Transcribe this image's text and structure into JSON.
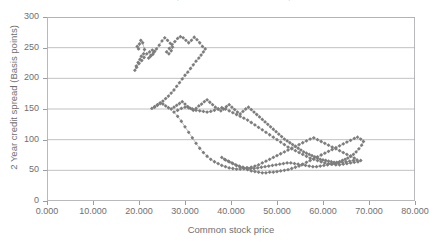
{
  "chart_data": {
    "type": "scatter",
    "title": "2 Year credit spread versus common stock price",
    "xlabel": "Common stock price",
    "ylabel": "2 Year credit spread (Basis points)",
    "xlim": [
      0,
      80
    ],
    "ylim": [
      0,
      300
    ],
    "xticks": [
      "0.000",
      "10.000",
      "20.000",
      "30.000",
      "40.000",
      "50.000",
      "60.000",
      "70.000",
      "80.000"
    ],
    "xtick_values": [
      0,
      10,
      20,
      30,
      40,
      50,
      60,
      70,
      80
    ],
    "yticks": [
      "0",
      "50",
      "100",
      "150",
      "200",
      "250",
      "300"
    ],
    "ytick_values": [
      0,
      50,
      100,
      150,
      200,
      250,
      300
    ],
    "grid": "horizontal",
    "legend": "none",
    "marker": "diamond",
    "marker_color": "#7d7d7d",
    "line_color": "#8e8e8e",
    "connected": true,
    "series": [
      {
        "name": "2 Year credit spread vs common stock price",
        "points": [
          [
            19.6,
            252
          ],
          [
            19.9,
            248
          ],
          [
            20.1,
            256
          ],
          [
            20.4,
            262
          ],
          [
            20.8,
            258
          ],
          [
            21.2,
            247
          ],
          [
            21.0,
            240
          ],
          [
            20.5,
            236
          ],
          [
            20.2,
            231
          ],
          [
            19.8,
            226
          ],
          [
            19.4,
            220
          ],
          [
            19.1,
            213
          ],
          [
            19.5,
            218
          ],
          [
            20.0,
            224
          ],
          [
            20.6,
            229
          ],
          [
            21.1,
            234
          ],
          [
            21.7,
            240
          ],
          [
            22.3,
            243
          ],
          [
            22.9,
            246
          ],
          [
            23.4,
            244
          ],
          [
            23.0,
            239
          ],
          [
            22.5,
            236
          ],
          [
            22.1,
            233
          ],
          [
            22.6,
            238
          ],
          [
            23.2,
            242
          ],
          [
            23.8,
            248
          ],
          [
            24.4,
            254
          ],
          [
            25.0,
            261
          ],
          [
            25.6,
            266
          ],
          [
            26.2,
            262
          ],
          [
            26.8,
            257
          ],
          [
            27.3,
            251
          ],
          [
            27.0,
            245
          ],
          [
            26.5,
            240
          ],
          [
            26.0,
            243
          ],
          [
            26.6,
            249
          ],
          [
            27.2,
            255
          ],
          [
            27.8,
            260
          ],
          [
            28.4,
            265
          ],
          [
            29.0,
            268
          ],
          [
            29.6,
            266
          ],
          [
            30.2,
            262
          ],
          [
            30.8,
            258
          ],
          [
            31.4,
            262
          ],
          [
            32.0,
            267
          ],
          [
            32.6,
            263
          ],
          [
            33.2,
            258
          ],
          [
            33.8,
            252
          ],
          [
            34.4,
            248
          ],
          [
            34.0,
            243
          ],
          [
            33.5,
            238
          ],
          [
            33.0,
            233
          ],
          [
            32.4,
            228
          ],
          [
            31.8,
            222
          ],
          [
            31.2,
            216
          ],
          [
            30.6,
            210
          ],
          [
            30.0,
            205
          ],
          [
            29.4,
            199
          ],
          [
            28.8,
            193
          ],
          [
            28.2,
            187
          ],
          [
            27.6,
            181
          ],
          [
            27.0,
            176
          ],
          [
            26.4,
            171
          ],
          [
            25.8,
            167
          ],
          [
            25.2,
            163
          ],
          [
            24.6,
            159
          ],
          [
            24.0,
            156
          ],
          [
            23.4,
            153
          ],
          [
            22.8,
            151
          ],
          [
            23.4,
            154
          ],
          [
            24.0,
            157
          ],
          [
            24.6,
            160
          ],
          [
            25.2,
            158
          ],
          [
            25.8,
            155
          ],
          [
            26.4,
            152
          ],
          [
            27.0,
            150
          ],
          [
            27.6,
            153
          ],
          [
            28.2,
            156
          ],
          [
            28.8,
            159
          ],
          [
            29.4,
            162
          ],
          [
            30.0,
            158
          ],
          [
            30.6,
            154
          ],
          [
            31.2,
            151
          ],
          [
            31.8,
            148
          ],
          [
            32.4,
            151
          ],
          [
            33.0,
            155
          ],
          [
            33.6,
            158
          ],
          [
            34.2,
            162
          ],
          [
            34.8,
            165
          ],
          [
            35.4,
            161
          ],
          [
            36.0,
            157
          ],
          [
            36.6,
            153
          ],
          [
            37.2,
            150
          ],
          [
            37.8,
            147
          ],
          [
            38.4,
            150
          ],
          [
            39.0,
            154
          ],
          [
            39.6,
            157
          ],
          [
            40.2,
            153
          ],
          [
            40.8,
            149
          ],
          [
            41.4,
            145
          ],
          [
            42.0,
            142
          ],
          [
            42.6,
            146
          ],
          [
            43.2,
            150
          ],
          [
            43.8,
            153
          ],
          [
            44.4,
            149
          ],
          [
            45.0,
            145
          ],
          [
            45.6,
            141
          ],
          [
            46.2,
            137
          ],
          [
            46.8,
            133
          ],
          [
            47.4,
            129
          ],
          [
            48.0,
            125
          ],
          [
            48.6,
            121
          ],
          [
            49.2,
            117
          ],
          [
            49.8,
            113
          ],
          [
            50.4,
            109
          ],
          [
            51.0,
            105
          ],
          [
            51.6,
            101
          ],
          [
            52.2,
            98
          ],
          [
            52.8,
            95
          ],
          [
            53.4,
            92
          ],
          [
            54.0,
            89
          ],
          [
            54.6,
            86
          ],
          [
            55.2,
            83
          ],
          [
            55.8,
            80
          ],
          [
            56.4,
            78
          ],
          [
            57.0,
            76
          ],
          [
            57.6,
            74
          ],
          [
            58.2,
            72
          ],
          [
            58.8,
            70
          ],
          [
            59.4,
            68
          ],
          [
            60.0,
            67
          ],
          [
            60.6,
            66
          ],
          [
            61.2,
            65
          ],
          [
            61.8,
            64
          ],
          [
            62.4,
            63
          ],
          [
            63.0,
            63
          ],
          [
            63.6,
            64
          ],
          [
            64.2,
            66
          ],
          [
            64.8,
            68
          ],
          [
            65.4,
            70
          ],
          [
            66.0,
            73
          ],
          [
            66.6,
            76
          ],
          [
            67.2,
            80
          ],
          [
            67.8,
            85
          ],
          [
            68.4,
            91
          ],
          [
            68.8,
            97
          ],
          [
            68.2,
            101
          ],
          [
            67.5,
            104
          ],
          [
            66.8,
            102
          ],
          [
            66.0,
            99
          ],
          [
            65.2,
            96
          ],
          [
            64.4,
            93
          ],
          [
            63.6,
            90
          ],
          [
            62.8,
            87
          ],
          [
            62.0,
            84
          ],
          [
            61.2,
            81
          ],
          [
            60.4,
            78
          ],
          [
            59.6,
            75
          ],
          [
            58.8,
            72
          ],
          [
            58.0,
            69
          ],
          [
            57.2,
            66
          ],
          [
            56.4,
            63
          ],
          [
            55.6,
            60
          ],
          [
            54.8,
            57
          ],
          [
            54.0,
            55
          ],
          [
            53.2,
            53
          ],
          [
            52.4,
            51
          ],
          [
            51.6,
            50
          ],
          [
            50.8,
            49
          ],
          [
            50.0,
            48
          ],
          [
            49.2,
            47
          ],
          [
            48.4,
            47
          ],
          [
            47.6,
            46
          ],
          [
            46.8,
            46
          ],
          [
            46.0,
            47
          ],
          [
            45.2,
            48
          ],
          [
            44.4,
            49
          ],
          [
            43.6,
            51
          ],
          [
            42.8,
            53
          ],
          [
            42.0,
            55
          ],
          [
            41.2,
            58
          ],
          [
            40.4,
            61
          ],
          [
            39.6,
            64
          ],
          [
            38.8,
            67
          ],
          [
            38.0,
            71
          ],
          [
            38.6,
            68
          ],
          [
            39.4,
            65
          ],
          [
            40.2,
            62
          ],
          [
            41.0,
            59
          ],
          [
            41.8,
            57
          ],
          [
            42.6,
            55
          ],
          [
            43.4,
            54
          ],
          [
            44.2,
            53
          ],
          [
            45.0,
            53
          ],
          [
            45.8,
            54
          ],
          [
            46.6,
            55
          ],
          [
            47.4,
            56
          ],
          [
            48.2,
            57
          ],
          [
            49.0,
            58
          ],
          [
            49.8,
            59
          ],
          [
            50.6,
            60
          ],
          [
            51.4,
            61
          ],
          [
            52.2,
            62
          ],
          [
            53.0,
            62
          ],
          [
            53.8,
            61
          ],
          [
            54.6,
            60
          ],
          [
            55.4,
            59
          ],
          [
            56.2,
            58
          ],
          [
            57.0,
            57
          ],
          [
            57.8,
            56
          ],
          [
            58.6,
            56
          ],
          [
            59.4,
            57
          ],
          [
            60.2,
            58
          ],
          [
            61.0,
            59
          ],
          [
            61.8,
            60
          ],
          [
            62.6,
            61
          ],
          [
            63.4,
            62
          ],
          [
            64.2,
            63
          ],
          [
            65.0,
            64
          ],
          [
            65.8,
            65
          ],
          [
            66.6,
            66
          ],
          [
            67.4,
            67
          ],
          [
            66.8,
            70
          ],
          [
            66.0,
            73
          ],
          [
            65.2,
            76
          ],
          [
            64.4,
            79
          ],
          [
            63.6,
            82
          ],
          [
            62.8,
            85
          ],
          [
            62.0,
            88
          ],
          [
            61.2,
            91
          ],
          [
            60.4,
            94
          ],
          [
            59.6,
            97
          ],
          [
            58.8,
            100
          ],
          [
            58.0,
            103
          ],
          [
            57.2,
            101
          ],
          [
            56.4,
            98
          ],
          [
            55.6,
            95
          ],
          [
            54.8,
            92
          ],
          [
            54.0,
            89
          ],
          [
            53.2,
            86
          ],
          [
            52.4,
            83
          ],
          [
            51.6,
            80
          ],
          [
            50.8,
            77
          ],
          [
            50.0,
            74
          ],
          [
            49.2,
            71
          ],
          [
            48.4,
            68
          ],
          [
            47.6,
            65
          ],
          [
            46.8,
            62
          ],
          [
            46.0,
            59
          ],
          [
            45.2,
            57
          ],
          [
            44.4,
            55
          ],
          [
            43.6,
            54
          ],
          [
            42.8,
            53
          ],
          [
            42.0,
            52
          ],
          [
            41.2,
            52
          ],
          [
            40.4,
            53
          ],
          [
            39.6,
            54
          ],
          [
            38.8,
            56
          ],
          [
            38.0,
            58
          ],
          [
            37.2,
            61
          ],
          [
            36.4,
            64
          ],
          [
            35.6,
            68
          ],
          [
            34.8,
            73
          ],
          [
            34.0,
            79
          ],
          [
            33.2,
            86
          ],
          [
            32.4,
            94
          ],
          [
            31.6,
            103
          ],
          [
            30.8,
            112
          ],
          [
            30.0,
            121
          ],
          [
            29.2,
            130
          ],
          [
            28.4,
            138
          ],
          [
            27.6,
            145
          ],
          [
            28.4,
            148
          ],
          [
            29.2,
            151
          ],
          [
            30.0,
            153
          ],
          [
            30.8,
            152
          ],
          [
            31.6,
            150
          ],
          [
            32.4,
            148
          ],
          [
            33.2,
            147
          ],
          [
            34.0,
            146
          ],
          [
            34.8,
            145
          ],
          [
            35.6,
            146
          ],
          [
            36.4,
            148
          ],
          [
            37.2,
            150
          ],
          [
            38.0,
            152
          ],
          [
            38.8,
            150
          ],
          [
            39.6,
            147
          ],
          [
            40.4,
            144
          ],
          [
            41.2,
            141
          ],
          [
            42.0,
            138
          ],
          [
            42.8,
            135
          ],
          [
            43.6,
            132
          ],
          [
            44.4,
            128
          ],
          [
            45.2,
            124
          ],
          [
            46.0,
            120
          ],
          [
            46.8,
            116
          ],
          [
            47.6,
            112
          ],
          [
            48.4,
            108
          ],
          [
            49.2,
            104
          ],
          [
            50.0,
            100
          ],
          [
            50.8,
            96
          ],
          [
            51.6,
            92
          ],
          [
            52.4,
            88
          ],
          [
            53.2,
            85
          ],
          [
            54.0,
            82
          ],
          [
            54.8,
            79
          ],
          [
            55.6,
            76
          ],
          [
            56.4,
            73
          ],
          [
            57.2,
            70
          ],
          [
            58.0,
            68
          ],
          [
            58.8,
            66
          ],
          [
            59.6,
            64
          ],
          [
            60.4,
            62
          ],
          [
            61.2,
            61
          ],
          [
            62.0,
            60
          ],
          [
            62.8,
            59
          ],
          [
            63.6,
            59
          ],
          [
            64.4,
            60
          ],
          [
            65.2,
            61
          ],
          [
            66.0,
            62
          ],
          [
            66.8,
            63
          ],
          [
            67.6,
            64
          ],
          [
            68.2,
            66
          ]
        ]
      }
    ]
  }
}
